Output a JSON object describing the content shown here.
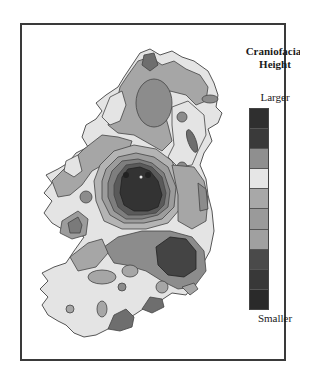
{
  "figure": {
    "title_line1": "Craniofacial",
    "title_line2": "Height",
    "region": "Ireland"
  },
  "legend": {
    "top_label": "Larger",
    "bottom_label": "Smaller",
    "segments": [
      {
        "level": 1,
        "color": "#2f2f2f"
      },
      {
        "level": 2,
        "color": "#3a3a3a"
      },
      {
        "level": 3,
        "color": "#8f8f8f"
      },
      {
        "level": 4,
        "color": "#e6e6e6"
      },
      {
        "level": 5,
        "color": "#a8a8a8"
      },
      {
        "level": 6,
        "color": "#9a9a9a"
      },
      {
        "level": 7,
        "color": "#a0a0a0"
      },
      {
        "level": 8,
        "color": "#4a4a4a"
      },
      {
        "level": 9,
        "color": "#383838"
      },
      {
        "level": 10,
        "color": "#2a2a2a"
      }
    ]
  },
  "colors": {
    "land_light": "#e4e4e4",
    "land_mid": "#a6a6a6",
    "land_midlight": "#c2c2c2",
    "land_dark": "#6e6e6e",
    "land_darker": "#3c3c3c",
    "contour_line": "#444444",
    "frame": "#3a3a3a"
  }
}
